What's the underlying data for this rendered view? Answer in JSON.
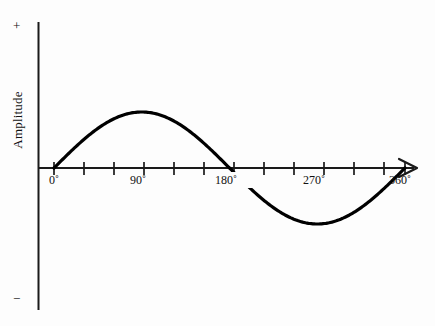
{
  "chart_data": {
    "type": "line",
    "title": "",
    "subtitle": "",
    "xlabel": "",
    "ylabel": "Amplitude",
    "grid": false,
    "legend": null,
    "xlim": [
      0,
      360
    ],
    "ylim": [
      -1,
      1
    ],
    "x_unit": "degrees",
    "x_tick_interval": 30,
    "x_ticks": [
      0,
      30,
      60,
      90,
      120,
      150,
      180,
      210,
      240,
      270,
      300,
      330,
      360
    ],
    "x_tick_labels": [
      "0˚",
      "",
      "",
      "90˚",
      "",
      "",
      "180˚",
      "",
      "",
      "270˚",
      "",
      "",
      "360˚"
    ],
    "labeled_ticks": [
      "0˚",
      "90˚",
      "180˚",
      "270˚",
      "360˚"
    ],
    "y_axis_top_marker": "+",
    "y_axis_bottom_marker": "−",
    "y_tick_labels": [],
    "series": [
      {
        "name": "sine",
        "function": "sin",
        "amplitude": 1,
        "period_degrees": 360,
        "phase_degrees": 0,
        "x": [
          0,
          15,
          30,
          45,
          60,
          75,
          90,
          105,
          120,
          135,
          150,
          165,
          180,
          195,
          210,
          225,
          240,
          255,
          270,
          285,
          300,
          315,
          330,
          345,
          360
        ],
        "values": [
          0,
          0.259,
          0.5,
          0.707,
          0.866,
          0.966,
          1,
          0.966,
          0.866,
          0.707,
          0.5,
          0.259,
          0,
          -0.259,
          -0.5,
          -0.707,
          -0.866,
          -0.966,
          -1,
          -0.966,
          -0.866,
          -0.707,
          -0.5,
          -0.259,
          0
        ]
      }
    ],
    "annotations": {
      "peak": {
        "x": 90,
        "y": 1
      },
      "trough": {
        "x": 270,
        "y": -1
      },
      "zero_crossings": [
        0,
        180,
        360
      ]
    }
  },
  "style": {
    "curve_color": "#000000",
    "axis_color": "#1a1a1a",
    "text_color": "#111111",
    "background": "#fdfdfd"
  }
}
